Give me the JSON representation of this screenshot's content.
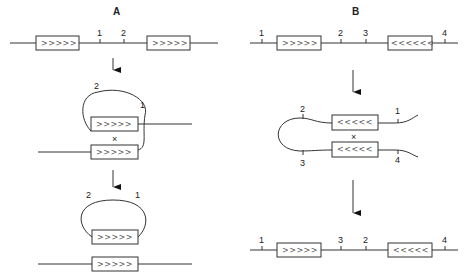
{
  "panels": {
    "A": {
      "title": "A",
      "step1": {
        "site_labels": [
          "1",
          "2"
        ],
        "repeat_glyphs": ">>>>>"
      },
      "step2": {
        "site_labels": [
          "2",
          "1"
        ],
        "repeat_glyphs": ">>>>>",
        "crossover": "×"
      },
      "step3": {
        "site_labels": [
          "2",
          "1"
        ],
        "repeat_glyphs": ">>>>>"
      }
    },
    "B": {
      "title": "B",
      "step1": {
        "site_labels": [
          "1",
          "2",
          "3",
          "4"
        ],
        "repeat_left": ">>>>>",
        "repeat_right": "<<<<<<"
      },
      "step2": {
        "site_labels": [
          "2",
          "1",
          "3",
          "4"
        ],
        "repeat_glyphs": "<<<<<",
        "crossover": "×"
      },
      "step3": {
        "site_labels": [
          "1",
          "3",
          "2",
          "4"
        ],
        "repeat_left": ">>>>>",
        "repeat_right": "<<<<<"
      }
    }
  }
}
